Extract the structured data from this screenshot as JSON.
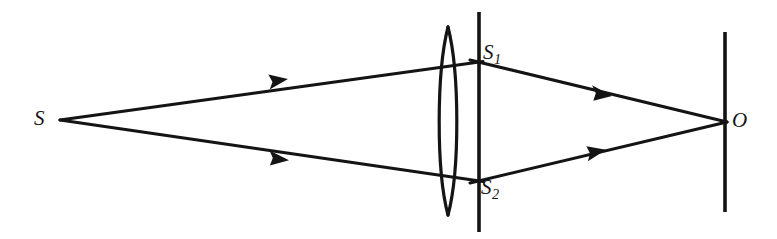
{
  "figure": {
    "background_color": "#ffffff",
    "ink_color": "#141414",
    "width": 777,
    "height": 239
  },
  "labels": {
    "source": "S",
    "slit_upper_base": "S",
    "slit_upper_sub": "1",
    "slit_lower_base": "S",
    "slit_lower_sub": "2",
    "observation_point": "O"
  },
  "optics": {
    "source_point": {
      "x": 60,
      "y": 120,
      "name": "S"
    },
    "lens": {
      "type": "biconvex",
      "center_x": 448,
      "top_y": 27,
      "bottom_y": 215,
      "half_width": 12
    },
    "barrier": {
      "name": "double-slit-screen",
      "x": 479,
      "top_y": 12,
      "bottom_y": 232
    },
    "slits": [
      {
        "label": "S1",
        "x": 479,
        "y": 63
      },
      {
        "label": "S2",
        "x": 479,
        "y": 180
      }
    ],
    "observation_screen": {
      "x": 725,
      "top_y": 32,
      "bottom_y": 212
    },
    "converge_point": {
      "x": 725,
      "y": 122,
      "name": "O"
    },
    "rays": [
      {
        "name": "upper-incident-ray",
        "from": {
          "x": 60,
          "y": 120
        },
        "to": {
          "x": 479,
          "y": 62
        },
        "arrow_at": {
          "x": 283,
          "y": 82
        }
      },
      {
        "name": "lower-incident-ray",
        "from": {
          "x": 60,
          "y": 120
        },
        "to": {
          "x": 479,
          "y": 181
        },
        "arrow_at": {
          "x": 284,
          "y": 158
        }
      },
      {
        "name": "upper-emergent-ray",
        "from": {
          "x": 479,
          "y": 62
        },
        "to": {
          "x": 725,
          "y": 122
        },
        "arrow_at": {
          "x": 607,
          "y": 93
        }
      },
      {
        "name": "lower-emergent-ray",
        "from": {
          "x": 479,
          "y": 181
        },
        "to": {
          "x": 725,
          "y": 122
        },
        "arrow_at": {
          "x": 601,
          "y": 153
        }
      }
    ]
  }
}
